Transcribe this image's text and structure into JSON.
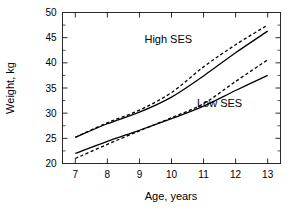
{
  "chart_data": {
    "type": "line",
    "title": "",
    "xlabel": "Age, years",
    "ylabel": "Weight, kg",
    "xlim": [
      6.6,
      13.4
    ],
    "ylim": [
      20,
      50
    ],
    "xticks": [
      7,
      8,
      9,
      10,
      11,
      12,
      13
    ],
    "yticks": [
      20,
      25,
      30,
      35,
      40,
      45,
      50
    ],
    "xtick_labels": [
      "7",
      "8",
      "9",
      "10",
      "11",
      "12",
      "13"
    ],
    "ytick_labels": [
      "20",
      "25",
      "30",
      "35",
      "40",
      "45",
      "50"
    ],
    "yminor_ticks": [
      22.5,
      27.5,
      32.5,
      37.5,
      42.5,
      47.5
    ],
    "grid": false,
    "legend": "in-plot annotations",
    "x": [
      7,
      8,
      9,
      10,
      11,
      12,
      13
    ],
    "series": [
      {
        "name": "High SES solid",
        "group": "High SES",
        "style": "solid",
        "values": [
          25.2,
          27.9,
          30.2,
          33.2,
          37.4,
          42.0,
          46.3
        ]
      },
      {
        "name": "High SES dashed",
        "group": "High SES",
        "style": "dashed",
        "values": [
          25.2,
          28.1,
          30.6,
          34.1,
          39.2,
          43.6,
          47.5
        ]
      },
      {
        "name": "Low SES solid",
        "group": "Low SES",
        "style": "solid",
        "values": [
          22.0,
          24.4,
          26.6,
          28.9,
          31.4,
          34.5,
          37.5
        ]
      },
      {
        "name": "Low SES dashed",
        "group": "Low SES",
        "style": "dashed",
        "values": [
          21.0,
          23.8,
          26.5,
          29.1,
          31.9,
          36.3,
          40.6
        ]
      }
    ],
    "annotations": [
      {
        "text": "High SES",
        "x": 9.9,
        "y": 44.0
      },
      {
        "text": "Low SES",
        "x": 11.5,
        "y": 31.3
      }
    ]
  },
  "axes": {
    "x_title": "Age, years",
    "y_title": "Weight, kg"
  },
  "annotations": {
    "high_ses": "High SES",
    "low_ses": "Low SES"
  },
  "colors": {
    "background": "#ffffff",
    "line": "#000000",
    "frame": "#2b2b2b",
    "text": "#000000"
  }
}
